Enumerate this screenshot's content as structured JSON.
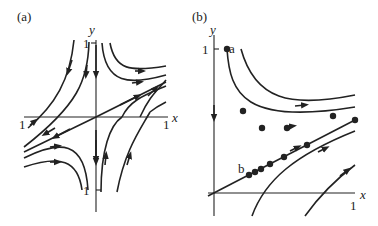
{
  "figure": {
    "panels": [
      {
        "id": "a",
        "label": "(a)",
        "x_axis_label": "x",
        "y_axis_label": "y",
        "tick_labels": {
          "x_left": "1",
          "x_right": "1",
          "y_top": "1",
          "y_bottom": "1"
        },
        "description": "Saddle phase portrait: trajectories approach origin along y-axis, leave along line y≈x/2"
      },
      {
        "id": "b",
        "label": "(b)",
        "x_axis_label": "x",
        "y_axis_label": "y",
        "tick_labels": {
          "x_right": "1",
          "y_top": "1"
        },
        "point_labels": [
          "a",
          "b"
        ],
        "description": "First-quadrant trajectories with marked sample points along solutions starting at a and b"
      }
    ]
  }
}
